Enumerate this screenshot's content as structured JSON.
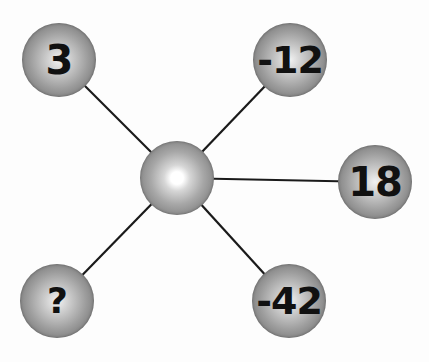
{
  "diagram": {
    "type": "number-wheel-puzzle",
    "hub": {
      "x": 177,
      "y": 178,
      "r": 37,
      "label": ""
    },
    "nodes": [
      {
        "id": "top-left",
        "label": "3",
        "x": 59,
        "y": 60,
        "r": 37,
        "font_size": 40
      },
      {
        "id": "top-right",
        "label": "-12",
        "x": 290,
        "y": 60,
        "r": 37,
        "font_size": 38
      },
      {
        "id": "right",
        "label": "18",
        "x": 375,
        "y": 182,
        "r": 37,
        "font_size": 40
      },
      {
        "id": "bottom-right",
        "label": "-42",
        "x": 289,
        "y": 301,
        "r": 37,
        "font_size": 38
      },
      {
        "id": "bottom-left",
        "label": "?",
        "x": 57,
        "y": 301,
        "r": 37,
        "font_size": 36
      }
    ],
    "edges": [
      {
        "from": "hub",
        "to": "top-left"
      },
      {
        "from": "hub",
        "to": "top-right"
      },
      {
        "from": "hub",
        "to": "right"
      },
      {
        "from": "hub",
        "to": "bottom-right"
      },
      {
        "from": "hub",
        "to": "bottom-left"
      }
    ],
    "colors": {
      "line": "#1a1a1a",
      "text": "#111111",
      "background": "#fdfdfd"
    }
  }
}
